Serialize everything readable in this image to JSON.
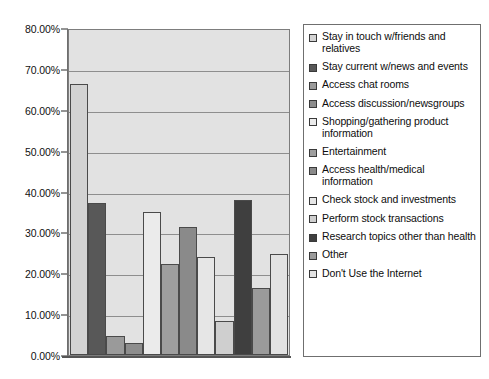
{
  "chart_data": {
    "type": "bar",
    "title": "",
    "xlabel": "",
    "ylabel": "",
    "ylim": [
      0,
      80
    ],
    "ytick_labels": [
      "80.00%",
      "70.00%",
      "60.00%",
      "50.00%",
      "40.00%",
      "30.00%",
      "20.00%",
      "10.00%",
      "0.00%"
    ],
    "ytick_values": [
      80,
      70,
      60,
      50,
      40,
      30,
      20,
      10,
      0
    ],
    "grid": true,
    "legend_position": "right",
    "categories": [
      "Stay in touch w/friends and relatives",
      "Stay current w/news and events",
      "Access chat rooms",
      "Access discussion/newsgroups",
      "Shopping/gathering product information",
      "Entertainment",
      "Access health/medical information",
      "Check stock and investments",
      "Perform stock transactions",
      "Research topics other than health",
      "Other",
      "Don't Use the Internet"
    ],
    "values": [
      66.3,
      37.2,
      4.6,
      2.9,
      35.1,
      22.2,
      31.3,
      24.0,
      8.3,
      38.0,
      16.4,
      24.7
    ],
    "colors": [
      "#d3d3d3",
      "#585858",
      "#9a9a9a",
      "#8d8d8d",
      "#ebebeb",
      "#9e9e9e",
      "#8a8a8a",
      "#e6e6e6",
      "#cfcfcf",
      "#3f3f3f",
      "#9b9b9b",
      "#e2e2e2"
    ],
    "plot_background": "#e2e2e2",
    "gridline_color": "#8e8e8e"
  },
  "legend": {
    "items": [
      {
        "label": "Stay in touch w/friends and relatives",
        "color": "#d3d3d3"
      },
      {
        "label": "Stay current w/news and events",
        "color": "#585858"
      },
      {
        "label": "Access chat rooms",
        "color": "#9a9a9a"
      },
      {
        "label": "Access discussion/newsgroups",
        "color": "#8d8d8d"
      },
      {
        "label": "Shopping/gathering product information",
        "color": "#ebebeb"
      },
      {
        "label": "Entertainment",
        "color": "#9e9e9e"
      },
      {
        "label": "Access health/medical information",
        "color": "#8a8a8a"
      },
      {
        "label": "Check stock and investments",
        "color": "#e6e6e6"
      },
      {
        "label": "Perform stock transactions",
        "color": "#cfcfcf"
      },
      {
        "label": "Research topics other than health",
        "color": "#3f3f3f"
      },
      {
        "label": "Other",
        "color": "#9b9b9b"
      },
      {
        "label": "Don't Use the Internet",
        "color": "#e2e2e2"
      }
    ]
  }
}
